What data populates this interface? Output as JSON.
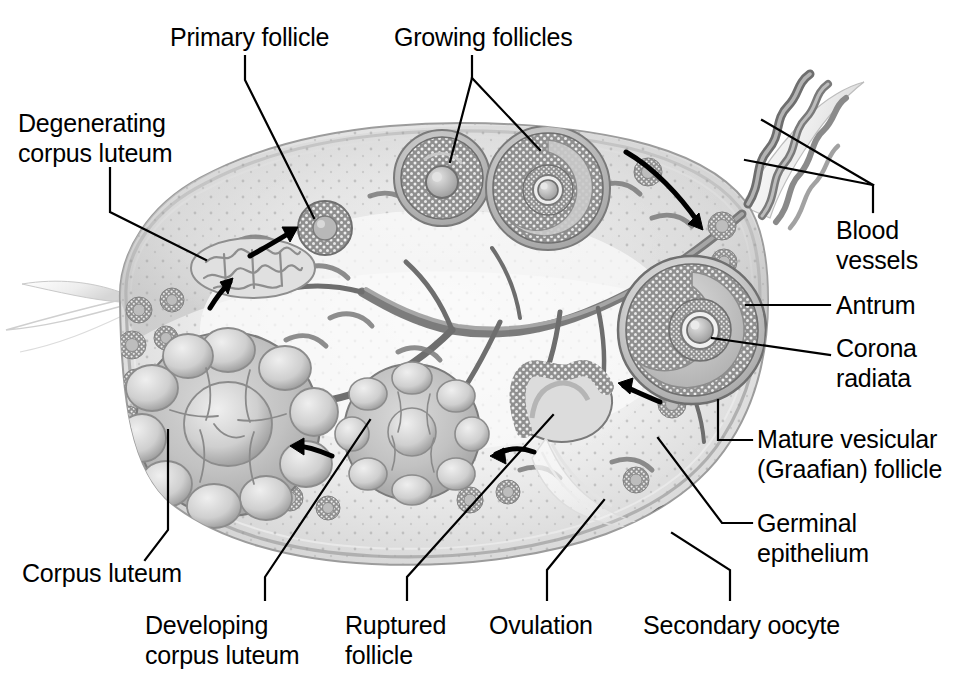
{
  "figure": {
    "type": "anatomical-illustration",
    "background_color": "#ffffff",
    "line_color": "#000000",
    "text_color": "#000000",
    "tissue_tones": {
      "stroma_light": "#f2f2f2",
      "stroma_mid": "#d8d8d8",
      "stroma_dark": "#9a9a9a",
      "vessel_dark": "#6f6f6f",
      "outline": "#8a8a8a",
      "granulosa": "#8c8c8c"
    }
  },
  "labels": [
    {
      "id": "degenerating-corpus-luteum",
      "line1": "Degenerating",
      "line2": "corpus luteum",
      "x": 18,
      "y": 108,
      "align": "left"
    },
    {
      "id": "primary-follicle",
      "line1": "Primary follicle",
      "line2": "",
      "x": 170,
      "y": 22,
      "align": "left"
    },
    {
      "id": "growing-follicles",
      "line1": "Growing follicles",
      "line2": "",
      "x": 394,
      "y": 22,
      "align": "left"
    },
    {
      "id": "blood-vessels",
      "line1": "Blood",
      "line2": "vessels",
      "x": 836,
      "y": 215,
      "align": "left"
    },
    {
      "id": "antrum",
      "line1": "Antrum",
      "line2": "",
      "x": 836,
      "y": 290,
      "align": "left"
    },
    {
      "id": "corona-radiata",
      "line1": "Corona",
      "line2": "radiata",
      "x": 836,
      "y": 333,
      "align": "left"
    },
    {
      "id": "mature-vesicular-graafian-follicle",
      "line1": "Mature vesicular",
      "line2": "(Graafian) follicle",
      "x": 757,
      "y": 424,
      "align": "left"
    },
    {
      "id": "germinal-epithelium",
      "line1": "Germinal",
      "line2": "epithelium",
      "x": 757,
      "y": 508,
      "align": "left"
    },
    {
      "id": "corpus-luteum",
      "line1": "Corpus luteum",
      "line2": "",
      "x": 22,
      "y": 558,
      "align": "left"
    },
    {
      "id": "developing-corpus-luteum",
      "line1": "Developing",
      "line2": "corpus luteum",
      "x": 145,
      "y": 610,
      "align": "left"
    },
    {
      "id": "ruptured-follicle",
      "line1": "Ruptured",
      "line2": "follicle",
      "x": 345,
      "y": 610,
      "align": "left"
    },
    {
      "id": "ovulation",
      "line1": "Ovulation",
      "line2": "",
      "x": 489,
      "y": 610,
      "align": "left"
    },
    {
      "id": "secondary-oocyte",
      "line1": "Secondary oocyte",
      "line2": "",
      "x": 643,
      "y": 610,
      "align": "left"
    }
  ],
  "leaders": [
    {
      "id": "leader-degenerating-corpus-luteum",
      "points": "110,168 110,212 206,260"
    },
    {
      "id": "leader-primary-follicle",
      "points": "245,56 245,80 314,218"
    },
    {
      "id": "leader-growing-follicles-left",
      "points": "472,56 472,78 450,162"
    },
    {
      "id": "leader-growing-follicles-right",
      "points": "472,78 540,150"
    },
    {
      "id": "leader-blood-vessels-upper",
      "points": "762,120 873,185"
    },
    {
      "id": "leader-blood-vessels-lower",
      "points": "745,160 873,185"
    },
    {
      "id": "leader-blood-vessels-stem",
      "points": "873,185 873,212"
    },
    {
      "id": "leader-antrum",
      "points": "746,305 830,305"
    },
    {
      "id": "leader-corona-radiata",
      "points": "712,338 830,355"
    },
    {
      "id": "leader-graafian",
      "points": "718,400 718,440 752,440"
    },
    {
      "id": "leader-germinal-epithelium",
      "points": "658,438 722,523 752,523"
    },
    {
      "id": "leader-corpus-luteum",
      "points": "168,430 168,530 145,560"
    },
    {
      "id": "leader-developing-corpus-luteum",
      "points": "370,420 265,577 265,600"
    },
    {
      "id": "leader-ruptured-follicle",
      "points": "553,415 407,577 407,600"
    },
    {
      "id": "leader-ovulation",
      "points": "604,500 547,570 547,600"
    },
    {
      "id": "leader-secondary-oocyte",
      "points": "672,533 730,570 730,600"
    }
  ],
  "cycle_arrows": [
    {
      "id": "arrow-to-primary-follicle",
      "from": "250,253",
      "to": "297,226",
      "direction": "up-right"
    },
    {
      "id": "arrow-to-degenerating-corpus",
      "from": "210,305",
      "to": "232,279",
      "direction": "up-right"
    },
    {
      "id": "arrow-to-developing-corpus",
      "from": "330,452",
      "to": "292,447",
      "direction": "left"
    },
    {
      "id": "arrow-to-corpus-luteum",
      "from": "533,449",
      "to": "492,452",
      "direction": "left"
    },
    {
      "id": "arrow-to-ruptured-follicle",
      "from": "660,400",
      "to": "620,385",
      "direction": "left"
    },
    {
      "id": "arrow-to-graafian-follicle",
      "from": "628,155",
      "to": "706,232",
      "direction": "down-right"
    }
  ],
  "structures": [
    {
      "id": "ovary-body",
      "name": "Ovary cross-section body"
    },
    {
      "id": "germinal-epithelium-layer",
      "name": "Germinal epithelium outer layer"
    },
    {
      "id": "primordial-follicles-cluster",
      "name": "Primordial follicles cluster"
    },
    {
      "id": "primary-follicle-body",
      "name": "Primary follicle"
    },
    {
      "id": "growing-follicle-1",
      "name": "Growing follicle (smaller)"
    },
    {
      "id": "growing-follicle-2",
      "name": "Growing follicle (larger)"
    },
    {
      "id": "graafian-follicle-body",
      "name": "Mature vesicular (Graafian) follicle"
    },
    {
      "id": "antrum-cavity",
      "name": "Antrum fluid cavity"
    },
    {
      "id": "corona-radiata-ring",
      "name": "Corona radiata around oocyte"
    },
    {
      "id": "ruptured-follicle-body",
      "name": "Ruptured follicle"
    },
    {
      "id": "ovulation-plume",
      "name": "Ovulation discharge plume"
    },
    {
      "id": "secondary-oocyte-body",
      "name": "Released secondary oocyte"
    },
    {
      "id": "developing-corpus-luteum-body",
      "name": "Developing corpus luteum"
    },
    {
      "id": "corpus-luteum-body",
      "name": "Corpus luteum"
    },
    {
      "id": "degenerating-corpus-luteum-body",
      "name": "Degenerating corpus luteum (corpus albicans)"
    },
    {
      "id": "blood-vessel-network",
      "name": "Blood vessel network in medulla"
    },
    {
      "id": "ovarian-hilum",
      "name": "Ovarian hilum with coiled vessels"
    }
  ]
}
